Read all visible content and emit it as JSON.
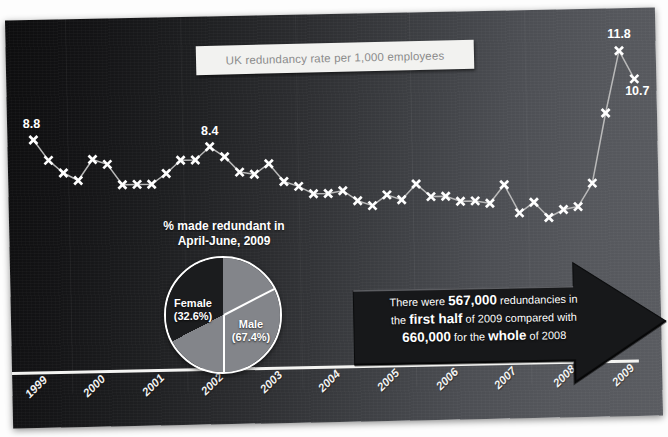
{
  "title": {
    "text": "UK redundancy rate per 1,000 employees"
  },
  "pie_block": {
    "caption_line1": "% made redundant in",
    "caption_line2": "April-June, 2009",
    "female_label": "Female",
    "female_value": "(32.6%)",
    "male_label": "Male",
    "male_value": "(67.4%)"
  },
  "callout": {
    "line1_a": "There were ",
    "line1_big": "567,000",
    "line1_b": " redundancies in",
    "line2_a": "the ",
    "line2_big": "first half",
    "line2_b": " of 2009 compared with",
    "line3_big": "660,000",
    "line3_a": " for the ",
    "line3_big2": "whole",
    "line3_b": " of 2008"
  },
  "colors": {
    "panel_dark": "#0d0d0e",
    "panel_light": "#5a5c61",
    "line": "#b9b9b9",
    "marker": "#ffffff",
    "pie_male": "#83858a",
    "pie_female": "#1b1c1e",
    "arrow": "#1a1b1d",
    "title_text": "#8b8b8b"
  },
  "chart_data": {
    "type": "line",
    "title": "UK redundancy rate per 1,000 employees",
    "xlabel": "",
    "ylabel": "Redundancy rate per 1,000 employees",
    "ylim": [
      4.0,
      12.4
    ],
    "grid": false,
    "legend": null,
    "marker_style": "x",
    "x_tick_labels": [
      "1999",
      "2000",
      "2001",
      "2002",
      "2003",
      "2004",
      "2005",
      "2006",
      "2007",
      "2008",
      "2009"
    ],
    "x_tick_values": [
      1999,
      2000,
      2001,
      2002,
      2003,
      2004,
      2005,
      2006,
      2007,
      2008,
      2009
    ],
    "annotations": [
      {
        "label": "8.8",
        "x": 1999.05,
        "y": 8.8
      },
      {
        "label": "8.4",
        "x": 2002.05,
        "y": 8.4
      },
      {
        "label": "11.8",
        "x": 2009.05,
        "y": 11.8
      },
      {
        "label": "10.7",
        "x": 2009.3,
        "y": 10.7
      }
    ],
    "series": [
      {
        "name": "UK redundancy rate per 1,000 employees",
        "x": [
          1999.05,
          1999.3,
          1999.55,
          1999.8,
          2000.05,
          2000.3,
          2000.55,
          2000.8,
          2001.05,
          2001.3,
          2001.55,
          2001.8,
          2002.05,
          2002.3,
          2002.55,
          2002.8,
          2003.05,
          2003.3,
          2003.55,
          2003.8,
          2004.05,
          2004.3,
          2004.55,
          2004.8,
          2005.05,
          2005.3,
          2005.55,
          2005.8,
          2006.05,
          2006.3,
          2006.55,
          2006.8,
          2007.05,
          2007.3,
          2007.55,
          2007.8,
          2008.05,
          2008.3,
          2008.55,
          2008.8,
          2009.05,
          2009.3
        ],
        "y": [
          8.8,
          8.0,
          7.5,
          7.2,
          8.0,
          7.8,
          7.0,
          7.0,
          7.0,
          7.4,
          7.9,
          7.9,
          8.4,
          8.0,
          7.4,
          7.3,
          7.7,
          7.0,
          6.8,
          6.5,
          6.5,
          6.6,
          6.2,
          6.0,
          6.4,
          6.2,
          6.8,
          6.3,
          6.3,
          6.1,
          6.1,
          6.0,
          6.7,
          5.6,
          6.0,
          5.4,
          5.7,
          5.8,
          6.7,
          9.4,
          11.8,
          10.7
        ]
      }
    ],
    "pie_inset": {
      "type": "pie",
      "title": "% made redundant in April-June, 2009",
      "labels": [
        "Male",
        "Female"
      ],
      "values": [
        67.4,
        32.6
      ],
      "value_labels": [
        "(67.4%)",
        "(32.6%)"
      ]
    },
    "callout_text": "There were 567,000 redundancies in the first half of 2009 compared with 660,000 for the whole of 2008"
  }
}
